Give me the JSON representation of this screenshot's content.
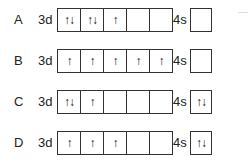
{
  "options": [
    {
      "label": "A",
      "d_label": "3d",
      "d_orbitals": [
        "↑↓",
        "↑↓",
        "↑",
        "",
        ""
      ],
      "s_label": "4s",
      "s_orbital": ""
    },
    {
      "label": "B",
      "d_label": "3d",
      "d_orbitals": [
        "↑",
        "↑",
        "↑",
        "↑",
        "↑"
      ],
      "s_label": "4s",
      "s_orbital": ""
    },
    {
      "label": "C",
      "d_label": "3d",
      "d_orbitals": [
        "↑↓",
        "↑",
        "",
        "",
        ""
      ],
      "s_label": "4s",
      "s_orbital": "↑↓"
    },
    {
      "label": "D",
      "d_label": "3d",
      "d_orbitals": [
        "↑",
        "↑",
        "↑",
        "",
        ""
      ],
      "s_label": "4s",
      "s_orbital": "↑↓"
    }
  ]
}
